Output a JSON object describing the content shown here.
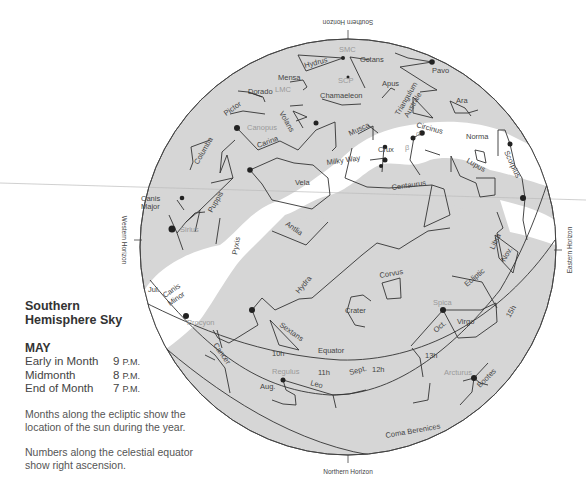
{
  "horizons": {
    "southern": "Southern Horizon",
    "northern": "Northern Horizon",
    "western": "Western Horizon",
    "eastern": "Eastern Horizon"
  },
  "legend": {
    "title_line1": "Southern",
    "title_line2": "Hemisphere Sky",
    "month": "MAY",
    "times": [
      {
        "label": "Early in Month",
        "hour": "9",
        "suffix": "P.M."
      },
      {
        "label": "Midmonth",
        "hour": "8",
        "suffix": "P.M."
      },
      {
        "label": "End of Month",
        "hour": "7",
        "suffix": "P.M."
      }
    ],
    "note_ecliptic": "Months along the ecliptic show the location of the sun during the year.",
    "note_equator": "Numbers along the celestial equator show right ascension."
  },
  "lines": {
    "equator": "Equator",
    "ecliptic": "Ecliptic",
    "milky_way": "Milky Way"
  },
  "right_ascension": [
    "10h",
    "11h",
    "12h",
    "13h",
    "15h"
  ],
  "ecliptic_months": [
    "Jul.",
    "Aug.",
    "Sept.",
    "Oct.",
    "Nov."
  ],
  "constellations": [
    "Octans",
    "Hydrus",
    "Mensa",
    "Dorado",
    "Pavo",
    "Apus",
    "Chamaeleon",
    "Pictor",
    "Volans",
    "Triangulum Australe",
    "Ara",
    "Columba",
    "Carina",
    "Musca",
    "Circinus",
    "Norma",
    "Crux",
    "Vela",
    "Scorpius",
    "Lupus",
    "Centaurus",
    "Canis Major",
    "Puppis",
    "Pyxis",
    "Antlia",
    "Libra",
    "Hydra",
    "Corvus",
    "Crater",
    "Canis Minor",
    "Sextans",
    "Cancer",
    "Virgo",
    "Leo",
    "Bootes",
    "Coma Berenices"
  ],
  "bright_stars": [
    "Canopus",
    "Sirius",
    "Procyon",
    "Spica",
    "Regulus",
    "Arcturus",
    "α",
    "β"
  ],
  "deep_sky": [
    "SMC",
    "LMC",
    "SCP"
  ],
  "colors": {
    "sky": "#d6d6d6",
    "milky_way": "#ffffff",
    "lines": "#333333",
    "star_label_grey": "#9a9a9a"
  }
}
